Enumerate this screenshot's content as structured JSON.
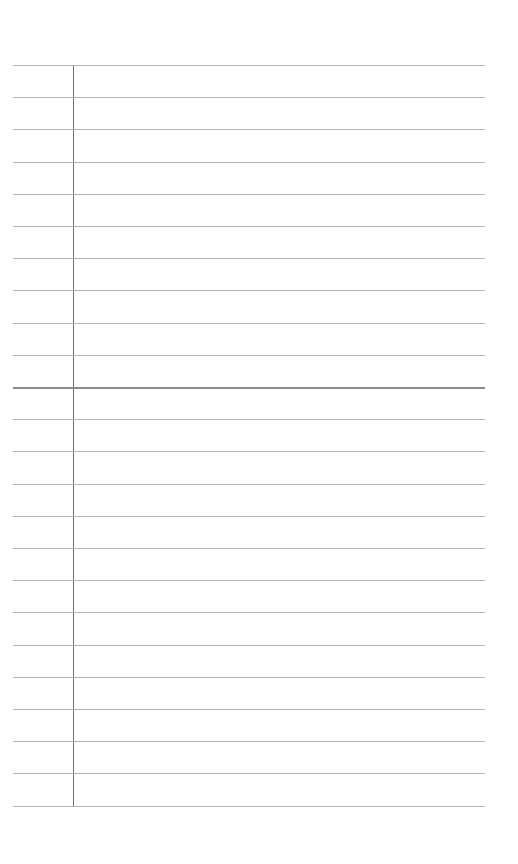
{
  "notepad": {
    "line_count": 24,
    "first_line_y": 65,
    "line_spacing": 32.2,
    "emphasized_line_index": 10,
    "line_color": "#b4b4b4",
    "emphasized_line_color": "#8a8a8a",
    "margin_line_color": "#6e6e6e",
    "lines": [
      "",
      "",
      "",
      "",
      "",
      "",
      "",
      "",
      "",
      "",
      "",
      "",
      "",
      "",
      "",
      "",
      "",
      "",
      "",
      "",
      "",
      "",
      "",
      ""
    ]
  }
}
